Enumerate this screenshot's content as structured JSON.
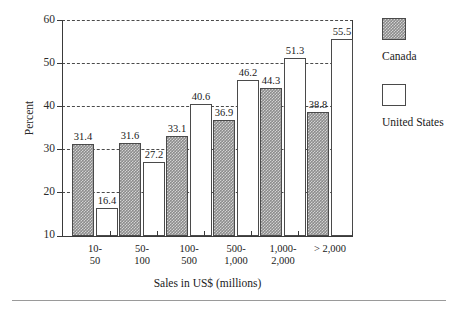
{
  "chart_data": {
    "type": "bar",
    "title": "",
    "xlabel": "Sales in US$ (millions)",
    "ylabel": "Percent",
    "ylim": [
      10,
      60
    ],
    "yticks": [
      10,
      20,
      30,
      40,
      50,
      60
    ],
    "grid": true,
    "grid_style": "dashed-horizontal",
    "legend_position": "right",
    "categories": [
      "10-50",
      "50-100",
      "100-500",
      "500-1,000",
      "1,000-2,000",
      "> 2,000"
    ],
    "categories_lines": [
      [
        "10-",
        "50"
      ],
      [
        "50-",
        "100"
      ],
      [
        "100-",
        "500"
      ],
      [
        "500-",
        "1,000"
      ],
      [
        "1,000-",
        "2,000"
      ],
      [
        "> 2,000",
        ""
      ]
    ],
    "series": [
      {
        "name": "Canada",
        "color": "#8c8c8c",
        "pattern": "checkered-gray",
        "values": [
          31.4,
          31.6,
          33.1,
          36.9,
          44.3,
          38.8
        ]
      },
      {
        "name": "United States",
        "color": "#ffffff",
        "pattern": "solid-white",
        "values": [
          16.4,
          27.2,
          40.6,
          46.2,
          51.3,
          55.5
        ]
      }
    ]
  },
  "axis": {
    "y_tick_labels": [
      "60",
      "50",
      "40",
      "30",
      "20",
      "10"
    ],
    "y_title": "Percent",
    "x_title": "Sales in US$ (millions)"
  },
  "legend": {
    "items": [
      {
        "label": "Canada"
      },
      {
        "label": "United States"
      }
    ]
  }
}
